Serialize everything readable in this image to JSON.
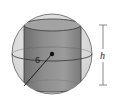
{
  "diagram": {
    "radius_label": "6",
    "height_label": "h",
    "colors": {
      "sphere_fill": "#e2e2e2",
      "sphere_stroke": "#6e6e6e",
      "cylinder_fill": "#8c8c8c",
      "cylinder_top": "#9a9a9a",
      "cylinder_stroke": "#3a3a3a",
      "dimension_line": "#7a7a7a",
      "center_point": "#111111"
    }
  }
}
